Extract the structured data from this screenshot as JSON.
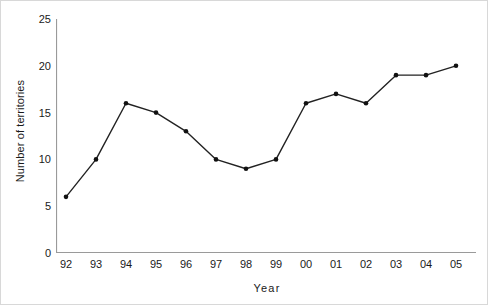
{
  "chart_data": {
    "type": "line",
    "title": "",
    "xlabel": "Year",
    "ylabel": "Number of territories",
    "categories": [
      "92",
      "93",
      "94",
      "95",
      "96",
      "97",
      "98",
      "99",
      "00",
      "01",
      "02",
      "03",
      "04",
      "05"
    ],
    "x": [
      1992,
      1993,
      1994,
      1995,
      1996,
      1997,
      1998,
      1999,
      2000,
      2001,
      2002,
      2003,
      2004,
      2005
    ],
    "values": [
      6,
      10,
      16,
      15,
      13,
      10,
      9,
      10,
      16,
      17,
      16,
      19,
      19,
      20
    ],
    "series": [
      {
        "name": "Number of territories",
        "values": [
          6,
          10,
          16,
          15,
          13,
          10,
          9,
          10,
          16,
          17,
          16,
          19,
          19,
          20
        ]
      }
    ],
    "ylim": [
      0,
      25
    ],
    "y_ticks": [
      0,
      5,
      10,
      15,
      20,
      25
    ],
    "y_tick_labels": [
      "0",
      "5",
      "10",
      "15",
      "20",
      "25"
    ],
    "grid": false,
    "legend": "none",
    "marker": "filled-circle",
    "line_color": "#222222",
    "marker_color": "#111111",
    "axis_color": "#9a9a9a",
    "text_color": "#1a1a1a",
    "background": "#ffffff"
  },
  "axes": {
    "y_title": "Number of territories",
    "x_title": "Year"
  }
}
